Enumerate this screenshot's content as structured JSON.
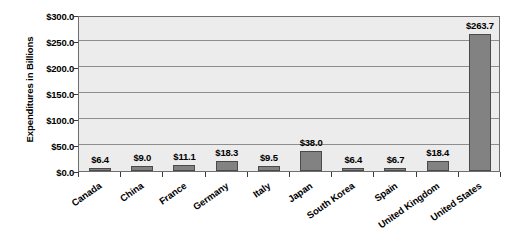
{
  "chart_data": {
    "type": "bar",
    "title": "",
    "subtitle": "",
    "xlabel": "",
    "ylabel": "Expenditures in Billions",
    "ylim": [
      0,
      300
    ],
    "ytick_step": 50,
    "ytick_labels": [
      "$300.0",
      "$250.0",
      "$200.0",
      "$150.0",
      "$100.0",
      "$50.0",
      "$0.0"
    ],
    "ytick_values": [
      300,
      250,
      200,
      150,
      100,
      50,
      0
    ],
    "grid": true,
    "legend": false,
    "legend_position": "none",
    "categories": [
      "Canada",
      "China",
      "France",
      "Germany",
      "Italy",
      "Japan",
      "South Korea",
      "Spain",
      "United Kingdom",
      "United States"
    ],
    "values": [
      6.4,
      9.0,
      11.1,
      18.3,
      9.5,
      38.0,
      6.4,
      6.7,
      18.4,
      263.7
    ],
    "data_labels": [
      "$6.4",
      "$9.0",
      "$11.1",
      "$18.3",
      "$9.5",
      "$38.0",
      "$6.4",
      "$6.7",
      "$18.4",
      "$263.7"
    ]
  },
  "style": {
    "bar_fill": "#828282",
    "bar_border": "#4a4a4a",
    "plot_background": "#ececec",
    "plot_border": "#6d6d6d",
    "gridline_color": "#8e8e8e",
    "text_color": "#000000",
    "page_background": "#ffffff"
  }
}
